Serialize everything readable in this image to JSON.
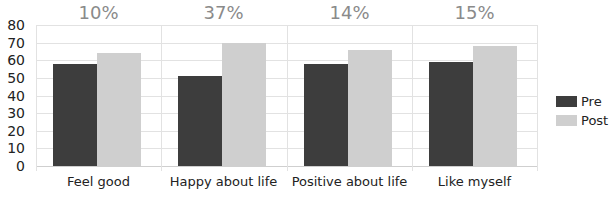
{
  "chart_data": {
    "type": "bar",
    "title": "",
    "xlabel": "",
    "ylabel": "",
    "ylim": [
      0,
      80
    ],
    "yticks": [
      0,
      10,
      20,
      30,
      40,
      50,
      60,
      70,
      80
    ],
    "grid": true,
    "legend_position": "right",
    "categories": [
      "Feel good",
      "Happy about life",
      "Positive about life",
      "Like myself"
    ],
    "series": [
      {
        "name": "Pre",
        "color": "#3d3d3d",
        "values": [
          58,
          51,
          58,
          59
        ]
      },
      {
        "name": "Post",
        "color": "#cfcfcf",
        "values": [
          64,
          70,
          66,
          68
        ]
      }
    ],
    "annotations": [
      "10%",
      "37%",
      "14%",
      "15%"
    ]
  }
}
